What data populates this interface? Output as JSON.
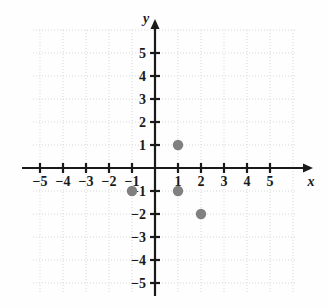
{
  "chart_data": {
    "type": "scatter",
    "title": "",
    "xlabel": "x",
    "ylabel": "y",
    "xlim": [
      -6,
      6
    ],
    "ylim": [
      -6,
      6
    ],
    "grid": true,
    "grid_style": "dotted",
    "legend": "none",
    "point_color": "#808080",
    "axis_color": "#1a1a1a",
    "grid_color": "#d8d8d8",
    "xticks": [
      -5,
      -4,
      -3,
      -2,
      -1,
      1,
      2,
      3,
      4,
      5
    ],
    "yticks": [
      5,
      4,
      3,
      2,
      1,
      -1,
      -2,
      -3,
      -4,
      -5
    ],
    "xtick_labels": [
      "-5",
      "-4",
      "-3",
      "-2",
      "-1",
      "1",
      "2",
      "3",
      "4",
      "5"
    ],
    "ytick_labels": [
      "5",
      "4",
      "3",
      "2",
      "1",
      "-1",
      "-2",
      "-3",
      "-4",
      "-5"
    ],
    "points": [
      {
        "label": "(1, 1)",
        "x": 1,
        "y": 1
      },
      {
        "label": "(-1, -1)",
        "x": -1,
        "y": -1
      },
      {
        "label": "(1, -1)",
        "x": 1,
        "y": -1
      },
      {
        "label": "(2, -2)",
        "x": 2,
        "y": -2
      }
    ]
  }
}
